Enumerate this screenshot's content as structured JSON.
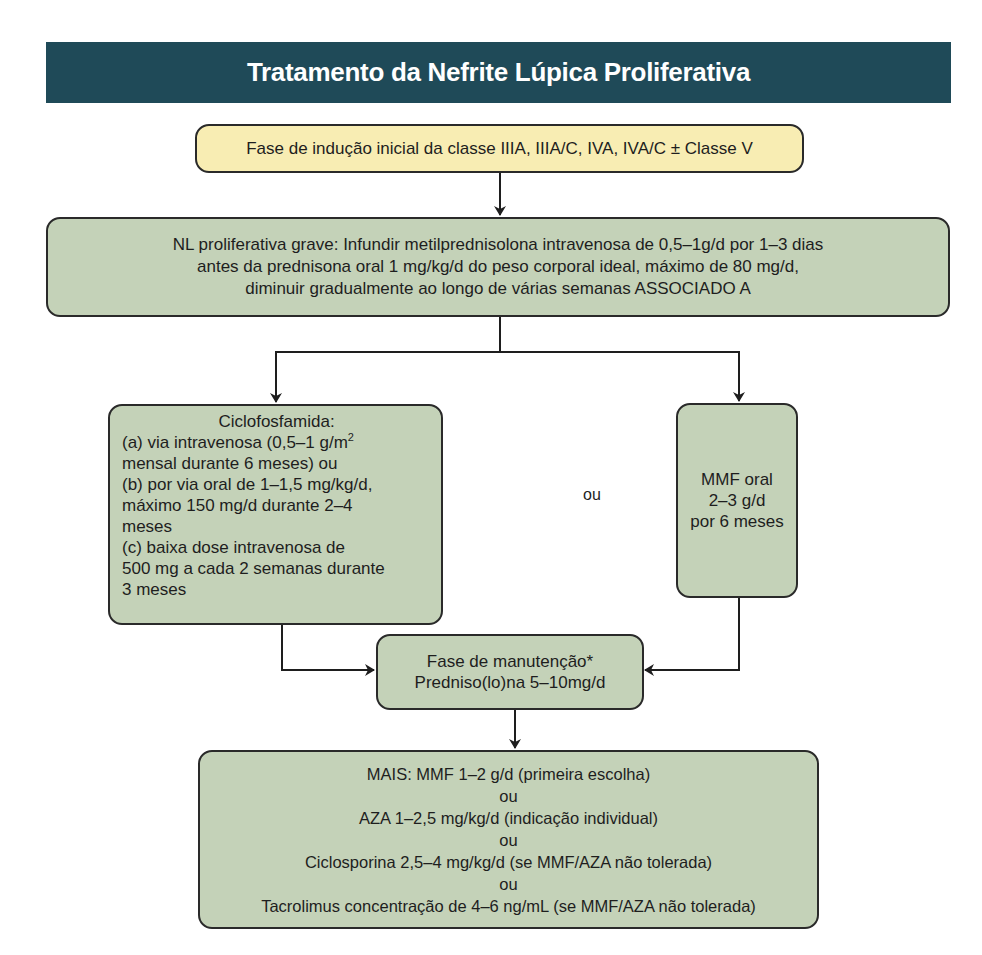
{
  "header": {
    "title": "Tratamento da Nefrite Lúpica Proliferativa",
    "color": "#1f4a58"
  },
  "nodes": {
    "induction": {
      "text": "Fase de indução inicial da classe IIIA, IIIA/C, IVA, IVA/C ± Classe V",
      "color": "#f8edb3"
    },
    "severe": {
      "lines": [
        "NL proliferativa grave: Infundir metilprednisolona intravenosa de 0,5–1g/d por 1–3 dias",
        "antes da prednisona oral 1 mg/kg/d do peso corporal ideal, máximo de 80 mg/d,",
        "diminuir gradualmente ao longo de várias semanas ASSOCIADO A"
      ],
      "color": "#c4d2b8"
    },
    "cyclophosphamide": {
      "title": "Ciclofosfamida:",
      "lines": [
        "(a) via intravenosa (0,5–1 g/m",
        "2",
        "mensal durante 6 meses) ou",
        "(b) por via oral de 1–1,5 mg/kg/d,",
        "máximo 150 mg/d durante 2–4",
        "meses",
        "(c) baixa dose intravenosa de",
        "500 mg a cada 2 semanas durante",
        "3 meses"
      ]
    },
    "or_label": "ou",
    "mmf": {
      "lines": [
        "MMF oral",
        "2–3 g/d",
        "por 6 meses"
      ]
    },
    "maintenance": {
      "lines": [
        "Fase de manutenção*",
        "Predniso(lo)na 5–10mg/d"
      ]
    },
    "plus": {
      "lines": [
        "MAIS: MMF 1–2 g/d (primeira escolha)",
        "ou",
        "AZA 1–2,5 mg/kg/d (indicação individual)",
        "ou",
        "Ciclosporina 2,5–4 mg/kg/d (se MMF/AZA não tolerada)",
        "ou",
        "Tacrolimus concentração de 4–6 ng/mL (se MMF/AZA não tolerada)"
      ]
    }
  }
}
